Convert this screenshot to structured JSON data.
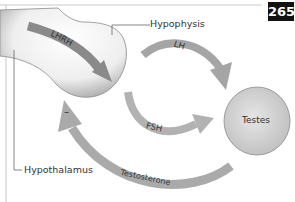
{
  "figure": {
    "page_number": "265",
    "labels": {
      "hypophysis": "Hypophysis",
      "hypothalamus": "Hypothalamus",
      "testes": "Testes"
    },
    "arrows": {
      "lhrh": "LHRH",
      "lh": "LH",
      "fsh": "FSH",
      "testosterone": "Testosterone",
      "feedback_sign": "–"
    },
    "colors": {
      "arrow_dark": "#8a8a8a",
      "arrow_light": "#b5b5b5",
      "organ_fill": "#f4f4f4",
      "testes_fill": "#cfcfcf",
      "frame": "#bdbdbd",
      "badge_bg": "#111111"
    }
  }
}
